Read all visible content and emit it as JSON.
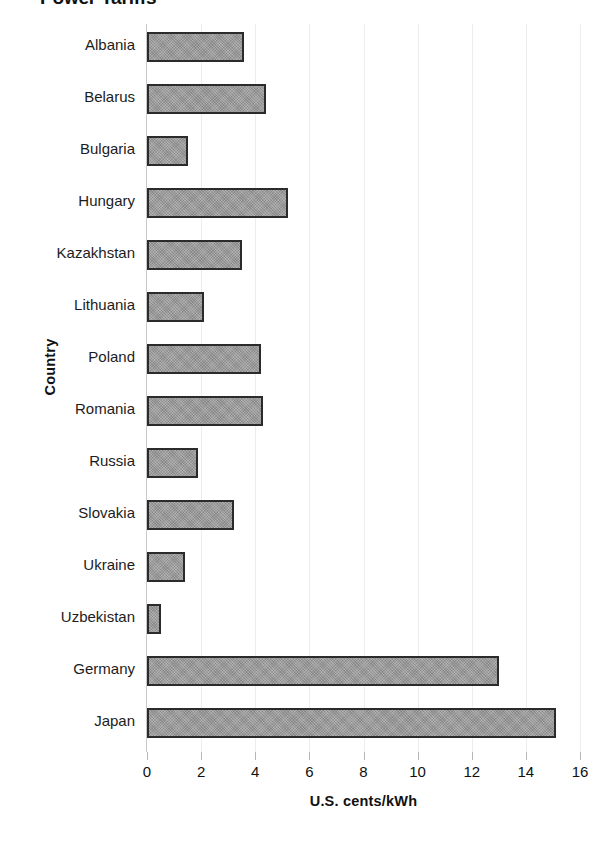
{
  "chart_data": {
    "type": "bar",
    "orientation": "horizontal",
    "title": "Power Tariffs",
    "xlabel": "U.S. cents/kWh",
    "ylabel": "Country",
    "xlim": [
      0,
      16
    ],
    "xticks": [
      0,
      2,
      4,
      6,
      8,
      10,
      12,
      14,
      16
    ],
    "xtick_labels": [
      "0",
      "2",
      "4",
      "6",
      "8",
      "10",
      "12",
      "14",
      "16"
    ],
    "grid": false,
    "legend": "none",
    "categories": [
      "Albania",
      "Belarus",
      "Bulgaria",
      "Hungary",
      "Kazakhstan",
      "Lithuania",
      "Poland",
      "Romania",
      "Russia",
      "Slovakia",
      "Ukraine",
      "Uzbekistan",
      "Germany",
      "Japan"
    ],
    "values": [
      3.6,
      4.4,
      1.5,
      5.2,
      3.5,
      2.1,
      4.2,
      4.3,
      1.9,
      3.2,
      1.4,
      0.5,
      13.0,
      15.1
    ],
    "series": [
      {
        "name": "Power tariff",
        "values": [
          3.6,
          4.4,
          1.5,
          5.2,
          3.5,
          2.1,
          4.2,
          4.3,
          1.9,
          3.2,
          1.4,
          0.5,
          13.0,
          15.1
        ]
      }
    ],
    "bar_fill_color": "#989898",
    "bar_border_color": "#2b2b2b",
    "axis_color": "#c9c9c9",
    "text_color": "#1a1a1a"
  }
}
